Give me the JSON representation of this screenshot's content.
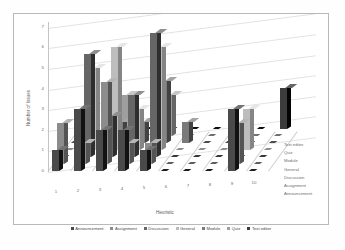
{
  "chart_data": {
    "type": "bar",
    "render": "3d-grouped-bar",
    "title": "",
    "xlabel": "Heuristic",
    "ylabel": "Number of Issues",
    "zlabel": "",
    "ylim": [
      0,
      7
    ],
    "yticks": [
      "0",
      "1",
      "2",
      "3",
      "4",
      "5",
      "6",
      "7"
    ],
    "categories": [
      "1",
      "2",
      "3",
      "4",
      "5",
      "6",
      "7",
      "8",
      "9",
      "10"
    ],
    "depth_categories": [
      "Announcement",
      "Assignment",
      "Discussion",
      "General",
      "Module",
      "Quiz",
      "Text editor"
    ],
    "depth_categories_far_to_near": [
      "Text editor",
      "Quiz",
      "Module",
      "General",
      "Discussion",
      "Assignment",
      "Announcement"
    ],
    "grid": true,
    "legend_position": "bottom",
    "legend": [
      "Announcement",
      "Assignment",
      "Discussion",
      "General",
      "Module",
      "Quiz",
      "Text editor"
    ],
    "series": [
      {
        "name": "Announcement",
        "color": "#4a4a4a",
        "values": [
          1,
          3,
          2,
          2,
          1,
          0,
          0,
          0,
          3,
          0
        ]
      },
      {
        "name": "Assignment",
        "color": "#8c8c8c",
        "values": [
          2,
          1,
          4,
          1,
          1,
          0,
          0,
          0,
          2,
          0
        ]
      },
      {
        "name": "Discussion",
        "color": "#666666",
        "values": [
          0,
          5,
          2,
          3,
          6,
          0,
          0,
          0,
          0,
          0
        ]
      },
      {
        "name": "General",
        "color": "#bdbdbd",
        "values": [
          0,
          4,
          5,
          2,
          5,
          0,
          0,
          0,
          2,
          0
        ]
      },
      {
        "name": "Module",
        "color": "#7a7a7a",
        "values": [
          0,
          0,
          1,
          1,
          3,
          1,
          0,
          0,
          0,
          0
        ]
      },
      {
        "name": "Quiz",
        "color": "#9e9e9e",
        "values": [
          0,
          0,
          2,
          0,
          2,
          0,
          0,
          0,
          0,
          0
        ]
      },
      {
        "name": "Text editor",
        "color": "#3c3c3c",
        "values": [
          0,
          0,
          0,
          0,
          0,
          0,
          0,
          0,
          0,
          2
        ]
      }
    ]
  }
}
